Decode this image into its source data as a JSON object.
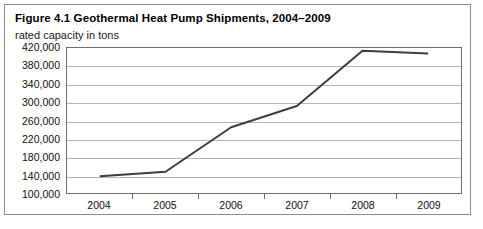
{
  "figure": {
    "title": "Figure 4.1 Geothermal Heat Pump Shipments, 2004–2009",
    "subtitle": "rated capacity in tons"
  },
  "colors": {
    "series_line": "#3d3d3d",
    "gridline": "#b5b5b5",
    "plot_border": "#6e6e6e",
    "figure_border": "#8d8d8d",
    "text": "#111111",
    "background": "#ffffff"
  },
  "chart_data": {
    "type": "line",
    "title": "Figure 4.1 Geothermal Heat Pump Shipments, 2004–2009",
    "subtitle": "rated capacity in tons",
    "xlabel": "",
    "ylabel": "",
    "categories": [
      "2004",
      "2005",
      "2006",
      "2007",
      "2008",
      "2009"
    ],
    "values": [
      137000,
      147000,
      245000,
      292000,
      414000,
      408000
    ],
    "series": [
      {
        "name": "Geothermal heat pump shipments (rated capacity in tons)",
        "values": [
          137000,
          147000,
          245000,
          292000,
          414000,
          408000
        ]
      }
    ],
    "ylim": [
      100000,
      420000
    ],
    "ytick_step": 40000,
    "ytick_labels": [
      "420,000",
      "380,000",
      "340,000",
      "300,000",
      "260,000",
      "220,000",
      "180,000",
      "140,000",
      "100,000"
    ],
    "ytick_values": [
      420000,
      380000,
      340000,
      300000,
      260000,
      220000,
      180000,
      140000,
      100000
    ],
    "xtick_labels": [
      "2004",
      "2005",
      "2006",
      "2007",
      "2008",
      "2009"
    ],
    "grid": "horizontal",
    "legend": "none",
    "markers": false
  }
}
